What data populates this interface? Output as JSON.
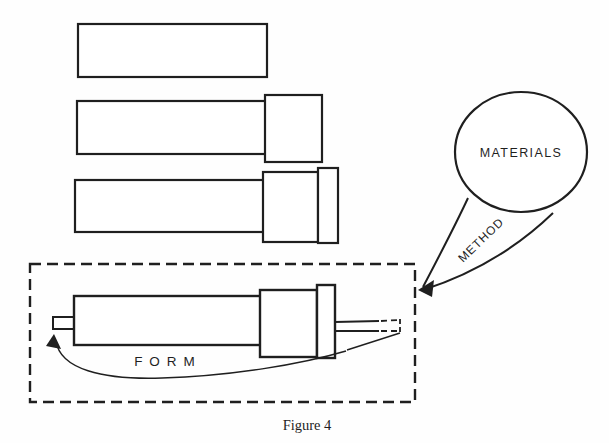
{
  "page": {
    "background_color": "#fefefe",
    "ink_color": "#1f1f1f"
  },
  "diagram": {
    "materials_label": "MATERIALS",
    "method_label": "METHOD",
    "form_label": "FORM",
    "caption": "Figure 4"
  }
}
